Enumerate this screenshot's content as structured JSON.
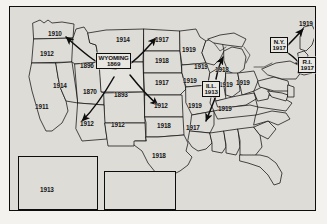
{
  "figure": {
    "type": "thematic-map",
    "region": "United States",
    "origin_state": "Wyoming",
    "origin_year": "1869"
  },
  "highlighted": [
    {
      "name": "wyoming",
      "line1": "WYOMING",
      "line2": "1869",
      "x": 94,
      "y": 52
    },
    {
      "name": "illinois",
      "line1": "ILL.",
      "line2": "1913",
      "x": 198,
      "y": 79
    },
    {
      "name": "new-york",
      "line1": "N.Y.",
      "line2": "1917",
      "x": 267,
      "y": 36
    },
    {
      "name": "rhode-island",
      "line1": "R.I.",
      "line2": "1917",
      "x": 296,
      "y": 56
    }
  ],
  "state_labels": [
    {
      "name": "washington",
      "year": "1910",
      "x": 41,
      "y": 27
    },
    {
      "name": "oregon",
      "year": "1912",
      "x": 33,
      "y": 49
    },
    {
      "name": "idaho",
      "year": "1896",
      "x": 74,
      "y": 61
    },
    {
      "name": "montana",
      "year": "1914",
      "x": 110,
      "y": 33
    },
    {
      "name": "north-dakota",
      "year": "1917",
      "x": 153,
      "y": 35
    },
    {
      "name": "south-dakota",
      "year": "1918",
      "x": 153,
      "y": 57
    },
    {
      "name": "nebraska",
      "year": "1917",
      "x": 153,
      "y": 79
    },
    {
      "name": "minnesota",
      "year": "1919",
      "x": 180,
      "y": 46
    },
    {
      "name": "wisconsin",
      "year": "1919",
      "x": 190,
      "y": 62
    },
    {
      "name": "michigan",
      "year": "1918",
      "x": 211,
      "y": 66
    },
    {
      "name": "iowa",
      "year": "1919",
      "x": 181,
      "y": 77
    },
    {
      "name": "nevada",
      "year": "1914",
      "x": 47,
      "y": 82
    },
    {
      "name": "california",
      "year": "1911",
      "x": 30,
      "y": 103
    },
    {
      "name": "utah",
      "year": "1870",
      "x": 79,
      "y": 88
    },
    {
      "name": "colorado",
      "year": "1893",
      "x": 110,
      "y": 91
    },
    {
      "name": "arizona",
      "year": "1912",
      "x": 74,
      "y": 120
    },
    {
      "name": "new-mexico",
      "year": "1912",
      "x": 107,
      "y": 121
    },
    {
      "name": "kansas",
      "year": "1912",
      "x": 152,
      "y": 103
    },
    {
      "name": "missouri",
      "year": "1919",
      "x": 186,
      "y": 102
    },
    {
      "name": "oklahoma",
      "year": "1918",
      "x": 155,
      "y": 122
    },
    {
      "name": "texas",
      "year": "1918",
      "x": 150,
      "y": 152
    },
    {
      "name": "arkansas",
      "year": "1917",
      "x": 184,
      "y": 124
    },
    {
      "name": "indiana",
      "year": "1919",
      "x": 216,
      "y": 81
    },
    {
      "name": "ohio",
      "year": "1919",
      "x": 232,
      "y": 79
    },
    {
      "name": "tennessee",
      "year": "1919",
      "x": 215,
      "y": 105
    },
    {
      "name": "maine",
      "year": "1919",
      "x": 296,
      "y": 20
    },
    {
      "name": "alaska",
      "year": "1913",
      "x": 36,
      "y": 185
    }
  ],
  "insets": [
    {
      "name": "alaska-inset",
      "x": 12,
      "y": 151,
      "w": 76,
      "h": 56
    },
    {
      "name": "hawaii-inset",
      "x": 92,
      "y": 166,
      "w": 64,
      "h": 41
    }
  ],
  "arrows": [
    {
      "name": "arrow-wyoming-to-washington",
      "from": "Wyoming",
      "to": "Washington"
    },
    {
      "name": "arrow-wyoming-to-montana",
      "from": "Wyoming",
      "to": "Montana"
    },
    {
      "name": "arrow-wyoming-to-arizona",
      "from": "Wyoming",
      "to": "Arizona"
    },
    {
      "name": "arrow-wyoming-to-kansas",
      "from": "Wyoming",
      "to": "Kansas"
    },
    {
      "name": "arrow-illinois-to-michigan",
      "from": "Illinois",
      "to": "Michigan"
    },
    {
      "name": "arrow-illinois-to-arkansas",
      "from": "Illinois",
      "to": "Arkansas"
    },
    {
      "name": "arrow-newyork-to-maine",
      "from": "New York",
      "to": "Maine"
    },
    {
      "name": "arrow-newyork-to-rhodeisland",
      "from": "New York",
      "to": "Rhode Island"
    }
  ],
  "colors": {
    "paper": "#f3f2ef",
    "map_fill": "#dedcd7",
    "ink": "#0d0d0d",
    "frame": "#0d0d0d"
  }
}
